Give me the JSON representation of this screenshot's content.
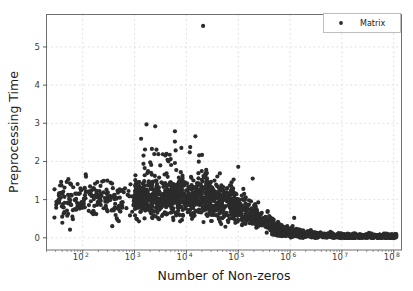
{
  "chart_data": {
    "type": "scatter",
    "title": "",
    "xlabel": "Number of Non-zeros",
    "ylabel": "Preprocessing Time",
    "xscale": "log",
    "yscale": "linear",
    "xlim": [
      20,
      141000000
    ],
    "ylim": [
      -0.32,
      5.85
    ],
    "grid": true,
    "grid_style": "dashed",
    "legend": {
      "position": "upper right",
      "entries": [
        {
          "name": "Matrix",
          "marker": "circle",
          "color": "#2b2b2b"
        }
      ]
    },
    "xticks": [
      {
        "value": 100,
        "label": "10",
        "exponent": "2"
      },
      {
        "value": 1000,
        "label": "10",
        "exponent": "3"
      },
      {
        "value": 10000,
        "label": "10",
        "exponent": "4"
      },
      {
        "value": 100000,
        "label": "10",
        "exponent": "5"
      },
      {
        "value": 1000000,
        "label": "10",
        "exponent": "6"
      },
      {
        "value": 10000000,
        "label": "10",
        "exponent": "7"
      },
      {
        "value": 100000000,
        "label": "10",
        "exponent": "8"
      }
    ],
    "yticks": [
      {
        "value": 0,
        "label": "0"
      },
      {
        "value": 1,
        "label": "1"
      },
      {
        "value": 2,
        "label": "2"
      },
      {
        "value": 3,
        "label": "3"
      },
      {
        "value": 4,
        "label": "4"
      },
      {
        "value": 5,
        "label": "5"
      }
    ],
    "marker_size": 2.1,
    "marker_color": "#2b2b2b",
    "n_points": 1650,
    "series": [
      {
        "name": "Matrix",
        "description": "Preprocessing time versus number of non-zeros for a collection of sparse matrices. Times cluster near 1.0s for small matrices and decay toward 0 as matrix size grows beyond 1e6 non-zeros.",
        "notable_points": [
          {
            "x": 21000,
            "y": 5.55,
            "note": "extreme outlier"
          },
          {
            "x": 1700,
            "y": 2.97
          },
          {
            "x": 2500,
            "y": 2.92
          },
          {
            "x": 6000,
            "y": 2.79
          },
          {
            "x": 6000,
            "y": 2.52
          },
          {
            "x": 6200,
            "y": 2.29
          },
          {
            "x": 20000,
            "y": 2.17
          },
          {
            "x": 6000,
            "y": 1.96
          },
          {
            "x": 100000,
            "y": 1.86
          },
          {
            "x": 190000,
            "y": 1.55
          },
          {
            "x": 1200000,
            "y": 0.52
          }
        ],
        "trend": {
          "low_x_median": 1.05,
          "mid_x_median": 0.85,
          "high_x_median": 0.06
        }
      }
    ]
  }
}
